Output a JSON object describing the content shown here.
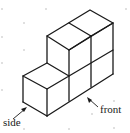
{
  "diagram": {
    "labels": {
      "side": "side",
      "front": "front"
    },
    "colors": {
      "edge": "#1a1a1a",
      "grid_dot": "#d6d6d6",
      "background": "#ffffff"
    },
    "structure": {
      "cube_count": 5,
      "description": "Back row of 2x2 stacked cubes with a single cube in front at the bottom left"
    }
  }
}
